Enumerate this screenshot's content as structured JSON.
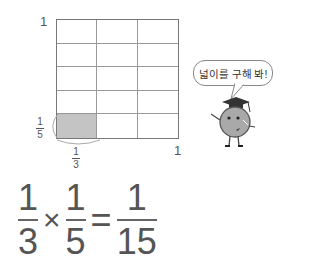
{
  "grid": {
    "rows": 5,
    "cols": 3,
    "shaded_cell": {
      "row": 5,
      "col": 1
    },
    "shade_color": "#c4c4c4",
    "label_top_left": "1",
    "label_bottom_right": "1",
    "label_row_fraction": {
      "num": "1",
      "den": "5"
    },
    "label_col_fraction": {
      "num": "1",
      "den": "3"
    }
  },
  "character": {
    "speech": "넓이를 구해 봐!",
    "icon": "graduate-ball-character-icon"
  },
  "equation": {
    "left": {
      "num": "1",
      "den": "3"
    },
    "operator": "×",
    "right": {
      "num": "1",
      "den": "5"
    },
    "equals": "=",
    "result": {
      "num": "1",
      "den": "15"
    }
  }
}
